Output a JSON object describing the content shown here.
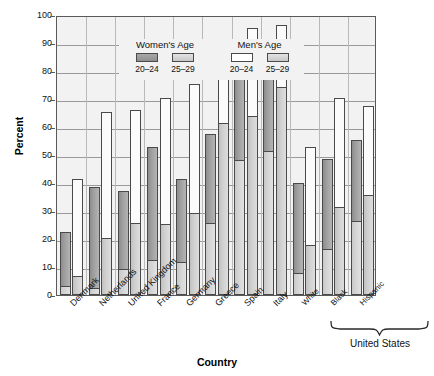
{
  "chart_data": {
    "type": "bar",
    "title": "",
    "xlabel": "Country",
    "ylabel": "Percent",
    "ylim": [
      0,
      100
    ],
    "yticks": [
      0,
      10,
      20,
      30,
      40,
      50,
      60,
      70,
      80,
      90,
      100
    ],
    "grid": true,
    "legend_position": "top-left inside plot",
    "legend": {
      "women_title": "Women's Age",
      "men_title": "Men's Age",
      "entries": [
        {
          "group": "Women's Age",
          "label": "20–24",
          "color": "#9a9a9a"
        },
        {
          "group": "Women's Age",
          "label": "25–29",
          "color": "#d4d4d4"
        },
        {
          "group": "Men's Age",
          "label": "20–24",
          "color": "#ffffff"
        },
        {
          "group": "Men's Age",
          "label": "25–29",
          "color": "#d4d4d4"
        }
      ]
    },
    "categories": [
      "Denmark",
      "Netherlands",
      "United Kingdom",
      "France",
      "Germany",
      "Greece",
      "Spain",
      "Italy",
      "White",
      "Black",
      "Hispanic"
    ],
    "group_bracket": {
      "label": "United States",
      "covers": [
        "White",
        "Black",
        "Hispanic"
      ]
    },
    "series": [
      {
        "name": "Women's Age 20–24",
        "values": [
          22.5,
          38.5,
          37.0,
          53.0,
          41.5,
          57.5,
          84.0,
          91.0,
          40.0,
          48.5,
          55.5
        ]
      },
      {
        "name": "Women's Age 25–29",
        "values": [
          3.0,
          2.0,
          9.0,
          12.0,
          11.5,
          25.5,
          48.0,
          51.0,
          7.5,
          16.0,
          26.0
        ]
      },
      {
        "name": "Men's Age 20–24",
        "values": [
          41.5,
          65.5,
          66.0,
          70.5,
          75.5,
          81.5,
          95.5,
          96.5,
          53.0,
          70.5,
          67.5
        ]
      },
      {
        "name": "Men's Age 25–29",
        "values": [
          6.5,
          20.0,
          25.5,
          25.0,
          29.0,
          61.0,
          63.5,
          74.0,
          17.5,
          31.0,
          35.5
        ]
      }
    ]
  }
}
